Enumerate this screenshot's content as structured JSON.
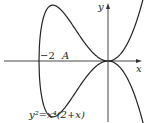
{
  "figure": {
    "equation": "y²=x⁴(2+x)",
    "axis_x_label": "x",
    "axis_y_label": "y",
    "tick_label": "−2",
    "point_label": "A",
    "colors": {
      "curve": "#222222",
      "axis": "#333333",
      "background": "#ffffff"
    }
  },
  "chart_data": {
    "type": "line",
    "xlabel": "x",
    "ylabel": "y",
    "xlim": [
      -2.6,
      1.05
    ],
    "ylim": [
      -1.8,
      1.75
    ],
    "annotations": [
      "-2",
      "A"
    ],
    "series": [
      {
        "name": "upper branch y = x^2*sqrt(2+x)",
        "x": [
          -2,
          -1.9,
          -1.75,
          -1.6,
          -1.4,
          -1.2,
          -1.0,
          -0.8,
          -0.6,
          -0.4,
          -0.2,
          0,
          0.2,
          0.4,
          0.6,
          0.8,
          1.0
        ],
        "y": [
          0,
          1.14,
          1.53,
          1.62,
          1.52,
          1.29,
          1.0,
          0.7,
          0.43,
          0.2,
          0.05,
          0,
          0.06,
          0.25,
          0.58,
          1.07,
          1.73
        ]
      },
      {
        "name": "lower branch y = -x^2*sqrt(2+x)",
        "x": [
          -2,
          -1.9,
          -1.75,
          -1.6,
          -1.4,
          -1.2,
          -1.0,
          -0.8,
          -0.6,
          -0.4,
          -0.2,
          0,
          0.2,
          0.4,
          0.6,
          0.8,
          1.0
        ],
        "y": [
          0,
          -1.14,
          -1.53,
          -1.62,
          -1.52,
          -1.29,
          -1.0,
          -0.7,
          -0.43,
          -0.2,
          -0.05,
          0,
          -0.06,
          -0.25,
          -0.58,
          -1.07,
          -1.73
        ]
      }
    ]
  }
}
